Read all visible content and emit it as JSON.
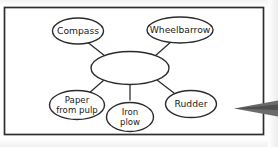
{
  "figure": {
    "type": "concept-web-diagram",
    "frame": {
      "border_color": "#2a2a2a",
      "background": "#ffffff"
    },
    "center_node": {
      "label": "",
      "note": "empty central ellipse"
    },
    "nodes": [
      {
        "id": "compass",
        "label": "Compass",
        "lines": [
          "Compass"
        ],
        "position": "top-left"
      },
      {
        "id": "wheelbarrow",
        "label": "Wheelbarrow",
        "lines": [
          "Wheelbarrow"
        ],
        "position": "top-right"
      },
      {
        "id": "paper",
        "label": "Paper from pulp",
        "lines": [
          "Paper",
          "from pulp"
        ],
        "position": "bottom-left"
      },
      {
        "id": "ironplow",
        "label": "Iron plow",
        "lines": [
          "Iron",
          "plow"
        ],
        "position": "bottom-center"
      },
      {
        "id": "rudder",
        "label": "Rudder",
        "lines": [
          "Rudder"
        ],
        "position": "bottom-right"
      }
    ],
    "connectors": [
      {
        "from": "center",
        "to": "compass"
      },
      {
        "from": "center",
        "to": "wheelbarrow"
      },
      {
        "from": "center",
        "to": "paper"
      },
      {
        "from": "center",
        "to": "ironplow"
      },
      {
        "from": "center",
        "to": "rudder"
      }
    ],
    "pointer": {
      "name": "arrow-pointer",
      "direction": "left",
      "color": "#5a5a5a"
    }
  }
}
